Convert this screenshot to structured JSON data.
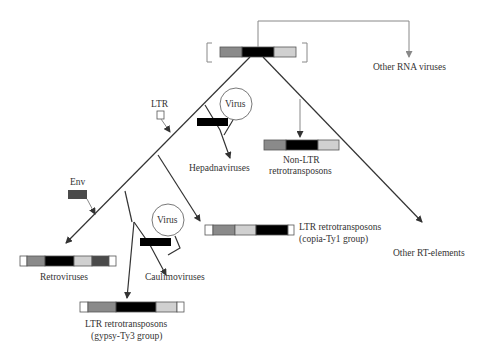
{
  "colors": {
    "ltr": "#ffffff",
    "gag": "#8a8a8a",
    "pol": "#000000",
    "rnaseh": "#d0d0d0",
    "env": "#4a4a4a",
    "line": "#333333",
    "gray_line": "#888888",
    "text": "#333333"
  },
  "labels": {
    "other_rna_viruses": "Other RNA viruses",
    "ltr": "LTR",
    "virus_1": "Virus",
    "hepadnaviruses": "Hepadnaviruses",
    "non_ltr_line1": "Non-LTR",
    "non_ltr_line2": "retrotransposons",
    "env": "Env",
    "virus_2": "Virus",
    "retroviruses": "Retroviruses",
    "caulimoviruses": "Caulimoviruses",
    "copia_line1": "LTR retrotransposons",
    "copia_line2": "(copia-Ty1 group)",
    "other_rt": "Other RT-elements",
    "gypsy_line1": "LTR retrotransposons",
    "gypsy_line2": "(gypsy-Ty3 group)"
  }
}
